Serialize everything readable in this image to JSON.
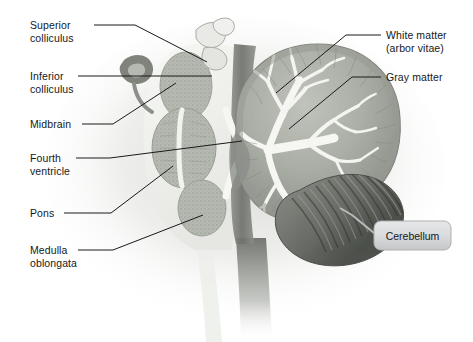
{
  "figure": {
    "background_color": "#ffffff",
    "leader_line_color": "#1a1a1a",
    "callout_line_color": "#b9bcbe",
    "tissue_colors": {
      "outer_halo": "#e8e8e6",
      "white_matter": "#f4f4f0",
      "gray_matter": "#b8bbb4",
      "gray_matter_dark": "#9fa39b",
      "cerebellum_cortex": "#a9aca4",
      "cerebellum_shadow": "#6f726c",
      "folia_dark": "#555853",
      "brainstem_shadow": "#73766f",
      "arbor_vitae": "#f6f6f2"
    }
  },
  "labels_left": [
    {
      "id": "superior-colliculus",
      "text_lines": [
        "Superior",
        "colliculus"
      ],
      "x": 30,
      "y": 19,
      "leader": {
        "x1": 94,
        "y1": 25,
        "x2": 135,
        "y2": 25,
        "x3": 207,
        "y3": 62
      }
    },
    {
      "id": "inferior-colliculus",
      "text_lines": [
        "Inferior",
        "colliculus"
      ],
      "x": 30,
      "y": 70,
      "leader": {
        "x1": 78,
        "y1": 76,
        "x2": 212,
        "y2": 76,
        "x3": 212,
        "y3": 76
      }
    },
    {
      "id": "midbrain",
      "text_lines": [
        "Midbrain"
      ],
      "x": 30,
      "y": 118,
      "leader": {
        "x1": 82,
        "y1": 124,
        "x2": 113,
        "y2": 124,
        "x3": 176,
        "y3": 83
      }
    },
    {
      "id": "fourth-ventricle",
      "text_lines": [
        "Fourth",
        "ventricle"
      ],
      "x": 30,
      "y": 152,
      "leader": {
        "x1": 76,
        "y1": 158,
        "x2": 110,
        "y2": 158,
        "x3": 242,
        "y3": 141
      }
    },
    {
      "id": "pons",
      "text_lines": [
        "Pons"
      ],
      "x": 30,
      "y": 207,
      "leader": {
        "x1": 64,
        "y1": 213,
        "x2": 111,
        "y2": 213,
        "x3": 173,
        "y3": 166
      }
    },
    {
      "id": "medulla-oblongata",
      "text_lines": [
        "Medulla",
        "oblongata"
      ],
      "x": 30,
      "y": 244,
      "leader": {
        "x1": 78,
        "y1": 250,
        "x2": 113,
        "y2": 250,
        "x3": 203,
        "y3": 215
      }
    }
  ],
  "labels_right": [
    {
      "id": "white-matter",
      "text_lines": [
        "White matter",
        "(arbor vitae)"
      ],
      "x": 386,
      "y": 29,
      "leader": {
        "x1": 381,
        "y1": 35,
        "x2": 346,
        "y2": 35,
        "x3": 276,
        "y3": 93
      }
    },
    {
      "id": "gray-matter",
      "text_lines": [
        "Gray matter"
      ],
      "x": 386,
      "y": 71,
      "leader": {
        "x1": 381,
        "y1": 77,
        "x2": 352,
        "y2": 77,
        "x3": 289,
        "y3": 129
      }
    }
  ],
  "callout": {
    "id": "cerebellum",
    "text": "Cerebellum",
    "box": {
      "x": 374,
      "y": 221,
      "width": 77,
      "height": 29,
      "radius": 7
    },
    "fill_top": "#e4e5e6",
    "fill_bottom": "#c6c8ca",
    "border_color": "#aeb1b3",
    "connector": {
      "x1": 374,
      "y1": 233,
      "x2": 352,
      "y2": 215,
      "x3": 340,
      "y3": 208
    }
  }
}
